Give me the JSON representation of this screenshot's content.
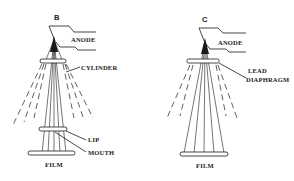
{
  "diagrams": [
    {
      "id": "B",
      "title": "B",
      "labels": {
        "anode": "ANODE",
        "cylinder": "CYLINDER",
        "lip": "LIP",
        "mouth": "MOUTH",
        "film": "FILM"
      }
    },
    {
      "id": "C",
      "title": "C",
      "labels": {
        "anode": "ANODE",
        "lead": "LEAD",
        "diaphragm": "DIAPHRAGM",
        "film": "FILM"
      }
    }
  ],
  "colors": {
    "ink": "#1a1a1a",
    "background": "#ffffff"
  }
}
